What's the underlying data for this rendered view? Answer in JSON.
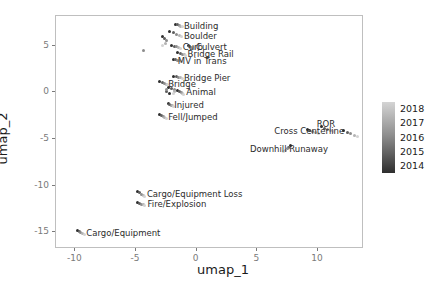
{
  "chart_data": {
    "type": "scatter",
    "title": "",
    "xlabel": "umap_1",
    "ylabel": "umap_2",
    "xlim": [
      -11.6,
      13.8
    ],
    "ylim": [
      -16.8,
      8.2
    ],
    "xticks": [
      "-10",
      "-5",
      "0",
      "5",
      "10"
    ],
    "xtickvalues": [
      -10,
      -5,
      0,
      5,
      10
    ],
    "yticks": [
      "5",
      "0",
      "-5",
      "-10",
      "-15"
    ],
    "ytickvalues": [
      5,
      0,
      -5,
      -10,
      -15
    ],
    "grid": false,
    "legend": {
      "position": "right",
      "type": "continuous-colorbar",
      "title": "",
      "labels": [
        "2018",
        "2017",
        "2016",
        "2015",
        "2014"
      ],
      "values": [
        2018,
        2017,
        2016,
        2015,
        2014
      ],
      "colors": [
        "#d4d4d4",
        "#b3b3b3",
        "#8c8c8c",
        "#5e5e5e",
        "#2e2e2e"
      ]
    },
    "annotations": [
      {
        "text": "Building",
        "x": -1.05,
        "y": 7.15
      },
      {
        "text": "Boulder",
        "x": -1.05,
        "y": 6.05
      },
      {
        "text": "Curb",
        "x": -1.15,
        "y": 4.85
      },
      {
        "text": "Culvert",
        "x": -0.05,
        "y": 4.85
      },
      {
        "text": "Bridge Rail",
        "x": -0.75,
        "y": 4.1
      },
      {
        "text": "MV in Trans",
        "x": -1.55,
        "y": 3.4
      },
      {
        "text": "Bridge Pier",
        "x": -1.05,
        "y": 1.55
      },
      {
        "text": "Bridge",
        "x": -2.35,
        "y": 0.9
      },
      {
        "text": "Animal",
        "x": -0.85,
        "y": 0.0
      },
      {
        "text": "Injured",
        "x": -1.85,
        "y": -1.35
      },
      {
        "text": "Fell/Jumped",
        "x": -2.35,
        "y": -2.65
      },
      {
        "text": "ROR",
        "x": 9.9,
        "y": -3.35
      },
      {
        "text": "Cross Centerline",
        "x": 6.4,
        "y": -4.1
      },
      {
        "text": "Downhill Runaway",
        "x": 4.4,
        "y": -6.05
      },
      {
        "text": "Cargo/Equipment Loss",
        "x": -4.1,
        "y": -10.9
      },
      {
        "text": "Fire/Explosion",
        "x": -4.05,
        "y": -11.95
      },
      {
        "text": "Cargo/Equipment",
        "x": -9.1,
        "y": -15.1
      }
    ],
    "series": [
      {
        "name": "Building",
        "points": [
          {
            "x": -1.75,
            "y": 7.3,
            "year": 2014
          },
          {
            "x": -1.58,
            "y": 7.25,
            "year": 2015
          },
          {
            "x": -1.42,
            "y": 7.18,
            "year": 2016
          },
          {
            "x": -1.3,
            "y": 7.1,
            "year": 2017
          },
          {
            "x": -1.18,
            "y": 7.02,
            "year": 2018
          }
        ]
      },
      {
        "name": "Boulder",
        "points": [
          {
            "x": -2.2,
            "y": 6.5,
            "year": 2014
          },
          {
            "x": -1.95,
            "y": 6.4,
            "year": 2015
          },
          {
            "x": -1.7,
            "y": 6.25,
            "year": 2016
          },
          {
            "x": -1.45,
            "y": 6.12,
            "year": 2017
          },
          {
            "x": -1.22,
            "y": 6.0,
            "year": 2018
          }
        ]
      },
      {
        "name": "Boulder-tail",
        "points": [
          {
            "x": -2.85,
            "y": 6.05,
            "year": 2014
          },
          {
            "x": -2.65,
            "y": 5.8,
            "year": 2015
          },
          {
            "x": -2.5,
            "y": 5.55,
            "year": 2016
          },
          {
            "x": -2.6,
            "y": 5.3,
            "year": 2017
          },
          {
            "x": -2.78,
            "y": 5.05,
            "year": 2018
          }
        ]
      },
      {
        "name": "Curb",
        "points": [
          {
            "x": -2.05,
            "y": 5.05,
            "year": 2014
          },
          {
            "x": -1.85,
            "y": 4.98,
            "year": 2015
          },
          {
            "x": -1.65,
            "y": 4.9,
            "year": 2016
          },
          {
            "x": -1.48,
            "y": 4.82,
            "year": 2017
          },
          {
            "x": -1.32,
            "y": 4.75,
            "year": 2018
          }
        ]
      },
      {
        "name": "Culvert",
        "points": [
          {
            "x": -0.7,
            "y": 5.0,
            "year": 2014
          },
          {
            "x": -0.55,
            "y": 4.92,
            "year": 2015
          },
          {
            "x": -0.42,
            "y": 4.85,
            "year": 2016
          },
          {
            "x": -0.3,
            "y": 4.78,
            "year": 2017
          },
          {
            "x": -0.2,
            "y": 4.72,
            "year": 2018
          }
        ]
      },
      {
        "name": "Bridge Rail",
        "points": [
          {
            "x": -1.55,
            "y": 4.25,
            "year": 2014
          },
          {
            "x": -1.35,
            "y": 4.18,
            "year": 2015
          },
          {
            "x": -1.18,
            "y": 4.12,
            "year": 2016
          },
          {
            "x": -1.02,
            "y": 4.05,
            "year": 2017
          },
          {
            "x": -0.88,
            "y": 3.98,
            "year": 2018
          }
        ]
      },
      {
        "name": "MV in Trans",
        "points": [
          {
            "x": -1.9,
            "y": 3.55,
            "year": 2014
          },
          {
            "x": -1.72,
            "y": 3.5,
            "year": 2015
          },
          {
            "x": -1.55,
            "y": 3.45,
            "year": 2016
          },
          {
            "x": -1.4,
            "y": 3.4,
            "year": 2017
          },
          {
            "x": -1.25,
            "y": 3.35,
            "year": 2018
          }
        ]
      },
      {
        "name": "outlier-left",
        "points": [
          {
            "x": -4.35,
            "y": 4.45,
            "year": 2016
          }
        ]
      },
      {
        "name": "Bridge Pier",
        "points": [
          {
            "x": -1.9,
            "y": 1.75,
            "year": 2014
          },
          {
            "x": -1.7,
            "y": 1.68,
            "year": 2015
          },
          {
            "x": -1.52,
            "y": 1.62,
            "year": 2016
          },
          {
            "x": -1.35,
            "y": 1.55,
            "year": 2017
          },
          {
            "x": -1.2,
            "y": 1.5,
            "year": 2018
          }
        ]
      },
      {
        "name": "Bridge",
        "points": [
          {
            "x": -3.05,
            "y": 1.15,
            "year": 2014
          },
          {
            "x": -2.85,
            "y": 1.05,
            "year": 2015
          },
          {
            "x": -2.68,
            "y": 0.98,
            "year": 2016
          },
          {
            "x": -2.52,
            "y": 0.9,
            "year": 2017
          },
          {
            "x": -2.38,
            "y": 0.82,
            "year": 2018
          }
        ]
      },
      {
        "name": "Bridge-loop",
        "points": [
          {
            "x": -2.35,
            "y": 0.55,
            "year": 2014
          },
          {
            "x": -2.05,
            "y": 0.45,
            "year": 2015
          },
          {
            "x": -1.85,
            "y": 0.3,
            "year": 2016
          },
          {
            "x": -1.8,
            "y": 0.05,
            "year": 2017
          },
          {
            "x": -1.95,
            "y": -0.15,
            "year": 2018
          },
          {
            "x": -2.25,
            "y": -0.1,
            "year": 2014
          },
          {
            "x": -2.45,
            "y": 0.12,
            "year": 2015
          },
          {
            "x": -2.5,
            "y": 0.35,
            "year": 2016
          }
        ]
      },
      {
        "name": "Animal",
        "points": [
          {
            "x": -1.55,
            "y": 0.2,
            "year": 2014
          },
          {
            "x": -1.4,
            "y": 0.1,
            "year": 2015
          },
          {
            "x": -1.28,
            "y": 0.0,
            "year": 2016
          },
          {
            "x": -1.15,
            "y": -0.1,
            "year": 2017
          },
          {
            "x": -1.05,
            "y": -0.2,
            "year": 2018
          }
        ]
      },
      {
        "name": "Injured",
        "points": [
          {
            "x": -2.35,
            "y": -1.2,
            "year": 2014
          },
          {
            "x": -2.22,
            "y": -1.28,
            "year": 2015
          },
          {
            "x": -2.1,
            "y": -1.35,
            "year": 2016
          },
          {
            "x": -2.0,
            "y": -1.42,
            "year": 2017
          },
          {
            "x": -1.92,
            "y": -1.48,
            "year": 2018
          }
        ]
      },
      {
        "name": "Fell/Jumped",
        "points": [
          {
            "x": -3.05,
            "y": -2.35,
            "year": 2014
          },
          {
            "x": -2.9,
            "y": -2.48,
            "year": 2015
          },
          {
            "x": -2.75,
            "y": -2.6,
            "year": 2016
          },
          {
            "x": -2.62,
            "y": -2.72,
            "year": 2017
          },
          {
            "x": -2.5,
            "y": -2.82,
            "year": 2018
          }
        ]
      },
      {
        "name": "Cross Centerline",
        "points": [
          {
            "x": 9.1,
            "y": -3.95,
            "year": 2014
          },
          {
            "x": 9.3,
            "y": -4.05,
            "year": 2015
          },
          {
            "x": 9.55,
            "y": -4.15,
            "year": 2016
          },
          {
            "x": 9.8,
            "y": -4.28,
            "year": 2017
          },
          {
            "x": 10.05,
            "y": -4.4,
            "year": 2018
          }
        ]
      },
      {
        "name": "ROR",
        "points": [
          {
            "x": 10.3,
            "y": -3.7,
            "year": 2014
          },
          {
            "x": 10.55,
            "y": -3.82,
            "year": 2015
          },
          {
            "x": 10.8,
            "y": -3.95,
            "year": 2016
          },
          {
            "x": 11.05,
            "y": -4.08,
            "year": 2017
          },
          {
            "x": 11.25,
            "y": -4.2,
            "year": 2018
          }
        ]
      },
      {
        "name": "right-cluster",
        "points": [
          {
            "x": 12.1,
            "y": -4.05,
            "year": 2014
          },
          {
            "x": 12.4,
            "y": -4.25,
            "year": 2015
          },
          {
            "x": 12.7,
            "y": -4.45,
            "year": 2016
          },
          {
            "x": 13.0,
            "y": -4.62,
            "year": 2017
          },
          {
            "x": 13.25,
            "y": -4.78,
            "year": 2018
          }
        ]
      },
      {
        "name": "Downhill Runaway",
        "points": [
          {
            "x": 7.75,
            "y": -5.7,
            "year": 2014
          },
          {
            "x": 7.6,
            "y": -5.88,
            "year": 2015
          },
          {
            "x": 7.45,
            "y": -6.05,
            "year": 2016
          },
          {
            "x": 7.3,
            "y": -6.22,
            "year": 2017
          },
          {
            "x": 7.18,
            "y": -6.38,
            "year": 2018
          }
        ]
      },
      {
        "name": "Cargo/Equipment Loss",
        "points": [
          {
            "x": -4.85,
            "y": -10.65,
            "year": 2014
          },
          {
            "x": -4.7,
            "y": -10.78,
            "year": 2015
          },
          {
            "x": -4.55,
            "y": -10.9,
            "year": 2016
          },
          {
            "x": -4.42,
            "y": -11.02,
            "year": 2017
          },
          {
            "x": -4.3,
            "y": -11.12,
            "year": 2018
          }
        ]
      },
      {
        "name": "Fire/Explosion",
        "points": [
          {
            "x": -4.9,
            "y": -11.8,
            "year": 2014
          },
          {
            "x": -4.72,
            "y": -11.9,
            "year": 2015
          },
          {
            "x": -4.55,
            "y": -11.98,
            "year": 2016
          },
          {
            "x": -4.4,
            "y": -12.05,
            "year": 2017
          },
          {
            "x": -4.28,
            "y": -12.12,
            "year": 2018
          }
        ]
      },
      {
        "name": "Cargo/Equipment",
        "points": [
          {
            "x": -9.85,
            "y": -14.85,
            "year": 2014
          },
          {
            "x": -9.7,
            "y": -14.95,
            "year": 2015
          },
          {
            "x": -9.55,
            "y": -15.05,
            "year": 2016
          },
          {
            "x": -9.4,
            "y": -15.15,
            "year": 2017
          },
          {
            "x": -9.28,
            "y": -15.25,
            "year": 2018
          }
        ]
      }
    ]
  }
}
